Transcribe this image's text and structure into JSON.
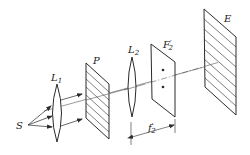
{
  "diagram": {
    "type": "optical-setup",
    "labels": {
      "source": "S",
      "lens1": "L",
      "lens1_sub": "1",
      "polarizer": "P",
      "lens2": "L",
      "lens2_sub": "2",
      "focal_plane": "F",
      "focal_plane_prime": "′",
      "focal_plane_sub": "2",
      "screen": "E",
      "focal_length": "f",
      "focal_length_prime": "′",
      "focal_length_sub": "2"
    },
    "colors": {
      "stroke": "#2a2a2a",
      "axis": "#555555",
      "background": "#ffffff"
    },
    "components": [
      "S",
      "L1",
      "P",
      "L2",
      "F'2",
      "E"
    ],
    "dots_on_focal_plane": 2,
    "grating_lines_P": 6,
    "grating_lines_E": 7
  }
}
